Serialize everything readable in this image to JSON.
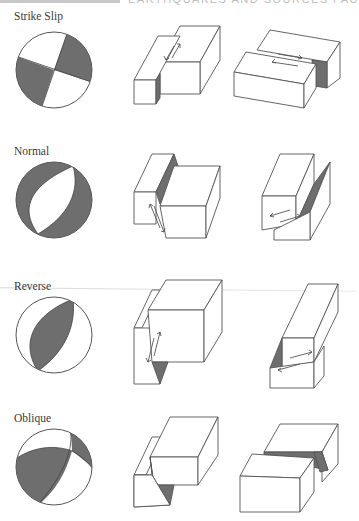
{
  "page": {
    "header_partial": "EARTHQUAKES AND SOURCES FAU",
    "colors": {
      "shade": "#6e6e6e",
      "line": "#555555",
      "background": "#ffffff"
    }
  },
  "rows": [
    {
      "label": "Strike Slip",
      "focal_mechanism": "quadrant beach ball: two dark opposing quadrants (upper-right, lower-left)",
      "block_diagrams": [
        "vertical fault, blocks offset laterally along strike with opposing arrows",
        "side view of horizontal lateral offset with opposing arrows on top face"
      ]
    },
    {
      "label": "Normal",
      "focal_mechanism": "dark outer crescents, white central lens (extension)",
      "block_diagrams": [
        "hanging wall dropped down exposing shaded fault scarp",
        "dipping fault plane with down-dip slip arrows"
      ]
    },
    {
      "label": "Reverse",
      "focal_mechanism": "dark central lens, white outer crescents (compression)",
      "block_diagrams": [
        "hanging wall pushed up over footwall, up-dip arrows",
        "thrust geometry with small shaded wedge and slip arrows"
      ]
    },
    {
      "label": "Oblique",
      "focal_mechanism": "asymmetric beach ball with mixed dark regions",
      "block_diagrams": [
        "combined vertical and lateral offset with shaded wedge",
        "lateral and vertical offset with shaded step along fault"
      ]
    }
  ]
}
